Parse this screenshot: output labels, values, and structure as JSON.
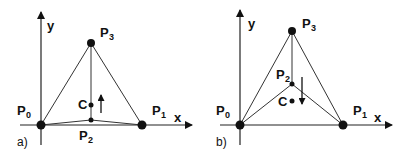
{
  "diagram": {
    "panels": [
      {
        "caption": "a)",
        "axes": {
          "x_label": "x",
          "y_label": "y"
        },
        "points": {
          "P0": {
            "label": "P",
            "sub": "0"
          },
          "P1": {
            "label": "P",
            "sub": "1"
          },
          "P2": {
            "label": "P",
            "sub": "2"
          },
          "P3": {
            "label": "P",
            "sub": "3"
          },
          "C": {
            "label": "C"
          }
        },
        "arrow_direction": "up"
      },
      {
        "caption": "b)",
        "axes": {
          "x_label": "x",
          "y_label": "y"
        },
        "points": {
          "P0": {
            "label": "P",
            "sub": "0"
          },
          "P1": {
            "label": "P",
            "sub": "1"
          },
          "P2": {
            "label": "P",
            "sub": "2"
          },
          "P3": {
            "label": "P",
            "sub": "3"
          },
          "C": {
            "label": "C"
          }
        },
        "arrow_direction": "down"
      }
    ],
    "colors": {
      "stroke": "#222222",
      "point": "#111111",
      "background": "#ffffff"
    }
  }
}
